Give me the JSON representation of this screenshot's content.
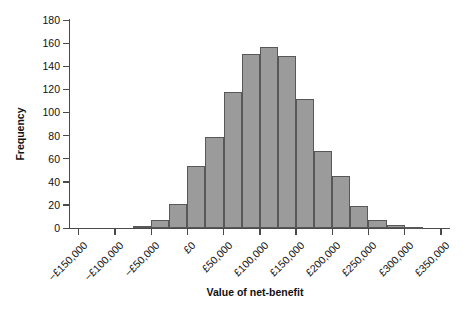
{
  "chart_data": {
    "type": "bar",
    "title": "",
    "subtitle": "",
    "xlabel": "Value of net-benefit",
    "ylabel": "Frequency",
    "xlim": [
      -162500,
      362500
    ],
    "ylim": [
      0,
      180
    ],
    "grid": false,
    "legend": null,
    "bin_width": 25000,
    "y_ticks": [
      0,
      20,
      40,
      60,
      80,
      100,
      120,
      140,
      160,
      180
    ],
    "y_tick_labels": [
      "0",
      "20",
      "40",
      "60",
      "80",
      "100",
      "120",
      "140",
      "160",
      "180"
    ],
    "x_ticks": [
      -150000,
      -100000,
      -50000,
      0,
      50000,
      100000,
      150000,
      200000,
      250000,
      300000,
      350000
    ],
    "x_tick_labels": [
      "−£150,000",
      "−£100,000",
      "−£50,000",
      "£0",
      "£50,000",
      "£100,000",
      "£150,000",
      "£200,000",
      "£250,000",
      "£300,000",
      "£350,000"
    ],
    "bar_color": "#9b9b9b",
    "bar_edge_color": "#585858",
    "axis_color": "#4a4a4a",
    "categories": [
      "−£75,000",
      "−£50,000",
      "−£25,000",
      "£0",
      "£25,000",
      "£50,000",
      "£75,000",
      "£100,000",
      "£125,000",
      "£150,000",
      "£175,000",
      "£200,000",
      "£225,000",
      "£250,000",
      "£275,000",
      "£300,000"
    ],
    "bin_starts": [
      -75000,
      -50000,
      -25000,
      0,
      25000,
      50000,
      75000,
      100000,
      125000,
      150000,
      175000,
      200000,
      225000,
      250000,
      275000,
      300000
    ],
    "values": [
      2,
      7,
      21,
      54,
      79,
      118,
      151,
      157,
      149,
      112,
      67,
      45,
      19,
      7,
      3,
      1
    ]
  }
}
